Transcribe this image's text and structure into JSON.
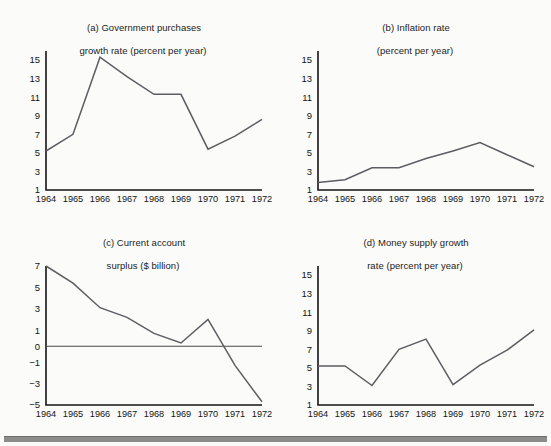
{
  "figure": {
    "background_color": "#fbfbfa",
    "line_color": "#5d5d63",
    "axis_color": "#141414",
    "rule_color": "#8c8c8c"
  },
  "panels": [
    {
      "key": "a",
      "title_line1": "(a) Government purchases",
      "title_line2": "growth rate (percent per year)"
    },
    {
      "key": "b",
      "title_line1": "(b) Inflation rate",
      "title_line2": "(percent per year)"
    },
    {
      "key": "c",
      "title_line1": "(c) Current account",
      "title_line2": "surplus ($ billion)"
    },
    {
      "key": "d",
      "title_line1": "(d) Money supply growth",
      "title_line2": "rate (percent per year)"
    }
  ],
  "chart_data": [
    {
      "type": "line",
      "panel": "a",
      "title": "(a) Government purchases growth rate (percent per year)",
      "xlabel": "",
      "ylabel": "",
      "categories": [
        "1964",
        "1965",
        "1966",
        "1967",
        "1968",
        "1969",
        "1970",
        "1971",
        "1972"
      ],
      "x": [
        1964,
        1965,
        1966,
        1967,
        1968,
        1969,
        1970,
        1971,
        1972
      ],
      "values": [
        5.2,
        7.0,
        15.3,
        13.2,
        11.3,
        11.3,
        5.4,
        6.8,
        8.6
      ],
      "yticks": [
        1,
        3,
        5,
        7,
        9,
        11,
        13,
        15
      ],
      "ytick_labels": [
        "1",
        "3",
        "5",
        "7",
        "9",
        "11",
        "13",
        "15"
      ],
      "ylim": [
        1,
        15.8
      ],
      "grid": false,
      "legend": false
    },
    {
      "type": "line",
      "panel": "b",
      "title": "(b) Inflation rate (percent per year)",
      "xlabel": "",
      "ylabel": "",
      "categories": [
        "1964",
        "1965",
        "1966",
        "1967",
        "1968",
        "1969",
        "1970",
        "1971",
        "1972"
      ],
      "x": [
        1964,
        1965,
        1966,
        1967,
        1968,
        1969,
        1970,
        1971,
        1972
      ],
      "values": [
        1.8,
        2.1,
        3.4,
        3.4,
        4.4,
        5.2,
        6.1,
        4.8,
        3.5
      ],
      "yticks": [
        1,
        3,
        5,
        7,
        9,
        11,
        13,
        15
      ],
      "ytick_labels": [
        "1",
        "3",
        "5",
        "7",
        "9",
        "11",
        "13",
        "15"
      ],
      "ylim": [
        1,
        15.8
      ],
      "grid": false,
      "legend": false
    },
    {
      "type": "line",
      "panel": "c",
      "title": "(c) Current account surplus ($ billion)",
      "xlabel": "",
      "ylabel": "",
      "categories": [
        "1964",
        "1965",
        "1966",
        "1967",
        "1968",
        "1969",
        "1970",
        "1971",
        "1972"
      ],
      "x": [
        1964,
        1965,
        1966,
        1967,
        1968,
        1969,
        1970,
        1971,
        1972
      ],
      "values": [
        7.0,
        5.4,
        3.1,
        2.2,
        0.8,
        0.2,
        2.0,
        -1.3,
        -4.7
      ],
      "yticks": [
        -5,
        -3,
        -1,
        0,
        1,
        3,
        5,
        7
      ],
      "ytick_labels": [
        "−5",
        "−3",
        "−1",
        "0",
        "1",
        "3",
        "5",
        "7"
      ],
      "ylim": [
        -5,
        7
      ],
      "zero_line": 0,
      "grid": false,
      "legend": false
    },
    {
      "type": "line",
      "panel": "d",
      "title": "(d) Money supply growth rate (percent per year)",
      "xlabel": "",
      "ylabel": "",
      "categories": [
        "1964",
        "1965",
        "1966",
        "1967",
        "1968",
        "1969",
        "1970",
        "1971",
        "1972"
      ],
      "x": [
        1964,
        1965,
        1966,
        1967,
        1968,
        1969,
        1970,
        1971,
        1972
      ],
      "values": [
        5.2,
        5.2,
        3.1,
        7.0,
        8.1,
        3.2,
        5.3,
        6.9,
        9.1
      ],
      "yticks": [
        1,
        3,
        5,
        7,
        9,
        11,
        13,
        15
      ],
      "ytick_labels": [
        "1",
        "3",
        "5",
        "7",
        "9",
        "11",
        "13",
        "15"
      ],
      "ylim": [
        1,
        15.8
      ],
      "grid": false,
      "legend": false
    }
  ]
}
